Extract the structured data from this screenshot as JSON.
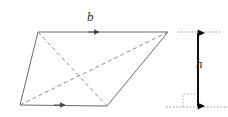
{
  "figure": {
    "kind": "geometry-diagram",
    "background_color": "#ffffff",
    "stroke_color": "#6b6b6b",
    "dash_color": "#8a8a8a",
    "dim_color": "#111111",
    "guide_color": "#9a9a9a",
    "labels": {
      "base": "b",
      "height": "h"
    },
    "parallelogram": {
      "top_left": [
        38,
        32
      ],
      "top_right": [
        168,
        32
      ],
      "bottom_right": [
        107,
        106
      ],
      "bottom_left": [
        20,
        105
      ]
    },
    "diagonals": [
      {
        "name": "diagonal-top-left-to-bottom-right",
        "from": [
          38,
          32
        ],
        "to": [
          107,
          106
        ],
        "style": "dashed"
      },
      {
        "name": "diagonal-bottom-left-to-top-right",
        "from": [
          20,
          105
        ],
        "to": [
          168,
          32
        ],
        "style": "dashed"
      }
    ],
    "arrow_markers": [
      {
        "name": "base-top-arrow",
        "at": [
          95,
          32
        ],
        "direction": "right"
      },
      {
        "name": "base-bottom-arrow",
        "at": [
          61,
          105
        ],
        "direction": "right"
      }
    ],
    "height_dimension": {
      "x": 198,
      "top_y": 32,
      "bottom_y": 107,
      "guide_top": {
        "x1": 178,
        "x2": 222,
        "y": 32
      },
      "guide_bottom": {
        "x1": 166,
        "x2": 228,
        "y": 107
      },
      "right_angle_marker": {
        "x": 183,
        "y": 93,
        "size": 12
      }
    }
  }
}
